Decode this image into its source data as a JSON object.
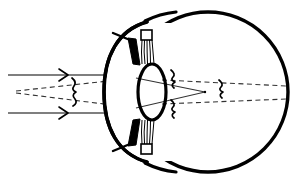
{
  "diagram": {
    "background_color": "#ffffff",
    "stroke_color": "#000000",
    "ray_color": "#4a4a4a",
    "canvas": {
      "width": 300,
      "height": 187
    },
    "structures": {
      "globe": {
        "name": "eyeball-sclera",
        "shape": "circle",
        "cx": 208,
        "cy": 92,
        "r": 80,
        "stroke_width": 3.2
      },
      "cornea": {
        "name": "cornea-arc",
        "shape": "arc",
        "description": "anterior bulge on left of globe",
        "stroke_width": 3.2
      },
      "lens": {
        "name": "crystalline-lens",
        "shape": "ellipse",
        "cx": 152,
        "cy": 92,
        "rx": 14,
        "ry": 28,
        "stroke_width": 3.0
      },
      "iris_top": {
        "name": "iris-upper-wedge",
        "shape": "tapered-wedge"
      },
      "iris_bottom": {
        "name": "iris-lower-wedge",
        "shape": "tapered-wedge"
      },
      "zonules_top": {
        "name": "zonule-fibers-upper",
        "fiber_count": 5
      },
      "zonules_bottom": {
        "name": "zonule-fibers-lower",
        "fiber_count": 5
      },
      "ciliary_top": {
        "name": "ciliary-body-upper"
      },
      "ciliary_bottom": {
        "name": "ciliary-body-lower"
      }
    },
    "rays": {
      "incoming_solid": {
        "name": "incoming-parallel-rays",
        "style": "solid",
        "count": 2,
        "y_values": [
          75,
          113
        ],
        "x_start": 8,
        "x_end": 120,
        "arrow_x": 64,
        "arrowhead": "chevron-right"
      },
      "virtual_dashed_left": {
        "name": "virtual-divergent-rays-left",
        "style": "dashed",
        "count": 2,
        "apex_x": 16,
        "apex_y": 92
      },
      "refracted_solid": {
        "name": "refracted-converging-rays",
        "style": "solid",
        "focus_x": 205,
        "focus_y": 92
      },
      "extended_dashed_right": {
        "name": "divergent-rays-to-retina",
        "style": "dashed",
        "retina_x": 287,
        "spread_y": [
          84,
          100
        ]
      }
    },
    "markers": {
      "wave_mid": {
        "name": "wavefront-marker-mid",
        "x": 76,
        "y": 92
      },
      "wave_post_lens_upper": {
        "name": "wavefront-marker-post-lens-upper",
        "x": 174,
        "y": 80
      },
      "wave_post_lens_lower": {
        "name": "wavefront-marker-post-lens-lower",
        "x": 174,
        "y": 104
      },
      "wave_focus": {
        "name": "wavefront-marker-focal",
        "x": 222,
        "y": 92
      }
    }
  }
}
